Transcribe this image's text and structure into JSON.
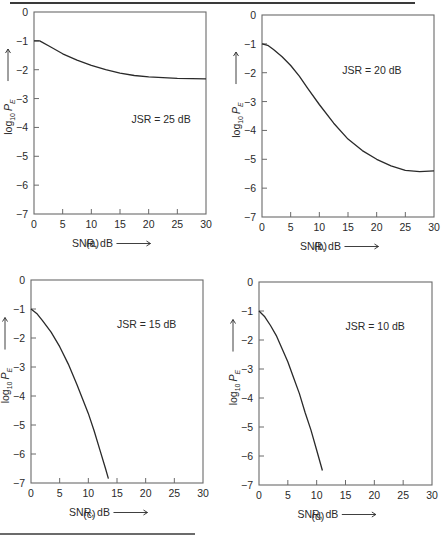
{
  "figure": {
    "shared": {
      "xlabel": "SNR, dB",
      "ylabel_base": "log",
      "ylabel_sub": "10",
      "ylabel_var": "P",
      "ylabel_var_sub": "E",
      "xticks": [
        0,
        5,
        10,
        15,
        20,
        25,
        30
      ],
      "yticks": [
        0,
        -1,
        -2,
        -3,
        -4,
        -5,
        -6,
        -7
      ],
      "ytick_labels": [
        "0",
        "−1",
        "−2",
        "−3",
        "−4",
        "−5",
        "−6",
        "−7"
      ],
      "xlim": [
        0,
        30
      ],
      "ylim": [
        -7,
        0
      ],
      "line_color": "#2a2a2a",
      "axis_color": "#6a6a6a"
    }
  },
  "chart_data": [
    {
      "type": "line",
      "panel_label": "(a)",
      "annotation": "JSR = 25 dB",
      "xlabel": "SNR, dB",
      "ylabel": "log10 P_E",
      "xlim": [
        0,
        30
      ],
      "ylim": [
        -7,
        0
      ],
      "grid": false,
      "x": [
        0,
        1,
        3,
        5,
        7.5,
        10,
        12.5,
        15,
        17.5,
        20,
        25,
        30
      ],
      "y": [
        -1.0,
        -1.0,
        -1.22,
        -1.45,
        -1.67,
        -1.85,
        -2.0,
        -2.12,
        -2.2,
        -2.25,
        -2.3,
        -2.32
      ],
      "box": {
        "left": 34,
        "top": 12,
        "right": 206,
        "bottom": 214
      },
      "annotation_pos": {
        "x": 17,
        "y": -3.7
      },
      "label_y": 247
    },
    {
      "type": "line",
      "panel_label": "(b)",
      "annotation": "JSR = 20 dB",
      "xlabel": "SNR, dB",
      "ylabel": "log10 P_E",
      "xlim": [
        0,
        30
      ],
      "ylim": [
        -7,
        0
      ],
      "grid": false,
      "x": [
        0,
        1,
        2,
        3.5,
        5,
        6.5,
        8,
        10,
        12.5,
        15,
        17.5,
        20,
        22.5,
        25,
        27.5,
        30
      ],
      "y": [
        -1.0,
        -1.05,
        -1.2,
        -1.45,
        -1.75,
        -2.12,
        -2.55,
        -3.1,
        -3.75,
        -4.3,
        -4.7,
        -5.0,
        -5.23,
        -5.38,
        -5.43,
        -5.4
      ],
      "box": {
        "left": 262,
        "top": 15,
        "right": 434,
        "bottom": 217
      },
      "annotation_pos": {
        "x": 14,
        "y": -1.9
      },
      "label_y": 250
    },
    {
      "type": "line",
      "panel_label": "(c)",
      "annotation": "JSR = 15 dB",
      "xlabel": "SNR, dB",
      "ylabel": "log10 P_E",
      "xlim": [
        0,
        30
      ],
      "ylim": [
        -7,
        0
      ],
      "grid": false,
      "x": [
        0,
        1,
        2,
        3.5,
        5,
        6.5,
        8,
        9,
        10,
        11,
        12,
        13,
        13.5
      ],
      "y": [
        -1.0,
        -1.15,
        -1.4,
        -1.8,
        -2.3,
        -2.9,
        -3.6,
        -4.1,
        -4.6,
        -5.2,
        -5.85,
        -6.5,
        -6.85
      ],
      "box": {
        "left": 31,
        "top": 280,
        "right": 203,
        "bottom": 483
      },
      "annotation_pos": {
        "x": 15,
        "y": -1.5
      },
      "label_y": 518
    },
    {
      "type": "line",
      "panel_label": "(d)",
      "annotation": "JSR = 10 dB",
      "xlabel": "SNR, dB",
      "ylabel": "log10 P_E",
      "xlim": [
        0,
        30
      ],
      "ylim": [
        -7,
        0
      ],
      "grid": false,
      "x": [
        0,
        1,
        2,
        3,
        4,
        5,
        6,
        7,
        8,
        9,
        10,
        11
      ],
      "y": [
        -1.0,
        -1.2,
        -1.5,
        -1.85,
        -2.3,
        -2.75,
        -3.3,
        -3.85,
        -4.5,
        -5.1,
        -5.8,
        -6.5
      ],
      "box": {
        "left": 259,
        "top": 282,
        "right": 432,
        "bottom": 485
      },
      "annotation_pos": {
        "x": 15,
        "y": -1.5
      },
      "label_y": 520
    }
  ]
}
